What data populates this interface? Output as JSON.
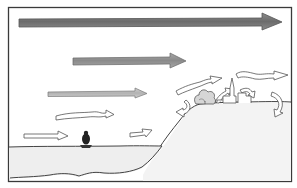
{
  "diagram": {
    "colors": {
      "background": "#ffffff",
      "frame": "#3a3a3a",
      "strong_wind": "#7a7a7a",
      "medium_wind": "#9a9a9a",
      "light_wind": "#c8c8c8",
      "outline_arrow": "#555555",
      "water": "#ececec",
      "land": "#f2f2f2",
      "ink": "#333333"
    },
    "elements": {
      "wind_arrows": [
        {
          "name": "top-wind-arrow",
          "style": "solid-dark",
          "x1": 18,
          "y1": 22,
          "x2": 282,
          "y2": 22,
          "thickness": 7
        },
        {
          "name": "upper-wind-arrow",
          "style": "solid-medium",
          "x1": 73,
          "y1": 61,
          "x2": 186,
          "y2": 61,
          "thickness": 6
        },
        {
          "name": "middle-wind-arrow",
          "style": "solid-light",
          "x1": 48,
          "y1": 94,
          "x2": 146,
          "y2": 94,
          "thickness": 4
        },
        {
          "name": "low-wavy-arrow",
          "style": "outline-wavy"
        },
        {
          "name": "surface-wind-arrow",
          "style": "outline"
        },
        {
          "name": "shore-arrow",
          "style": "outline"
        },
        {
          "name": "hill-wavy-arrow-left",
          "style": "outline-wavy"
        },
        {
          "name": "hill-wavy-arrow-right",
          "style": "outline-wavy"
        },
        {
          "name": "turbulence-arrows",
          "style": "outline-curved",
          "count": 5
        }
      ],
      "water": {
        "name": "sea"
      },
      "boat": {
        "name": "boat-with-person"
      },
      "hill": {
        "name": "coastal-hill"
      },
      "trees": {
        "name": "tree-cluster"
      },
      "church": {
        "name": "church-spire"
      },
      "buildings": {
        "name": "town-buildings"
      }
    }
  }
}
